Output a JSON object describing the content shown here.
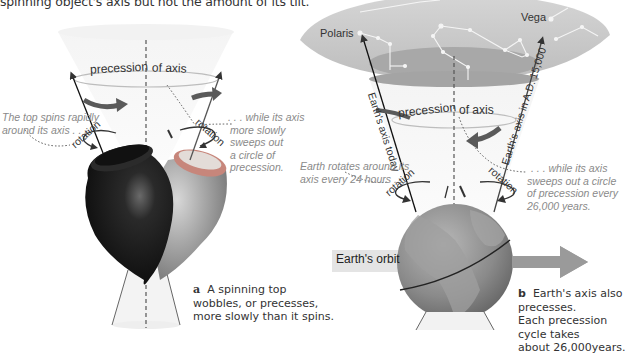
{
  "intro_text": "spinning object's axis but not the amount of its tilt.",
  "panel_a": {
    "cone_label_left": "precession",
    "cone_label_right": "of axis",
    "rotation_left": "rotation",
    "rotation_right": "rotation",
    "note_left": [
      "The top spins rapidly",
      "around its axis . . ."
    ],
    "note_right": [
      ". . . while its axis",
      "more slowly",
      "sweeps out",
      "a circle of",
      "precession."
    ],
    "caption_letter": "a",
    "caption_lines": [
      "A spinning top",
      "wobbles, or precesses,",
      "more slowly than it spins."
    ]
  },
  "panel_b": {
    "star_polaris": "Polaris",
    "star_vega": "Vega",
    "cone_label_left": "precession",
    "cone_label_right": "of axis",
    "axis_today": "Earth's axis today",
    "axis_future": "Earth's axis in A.D. 15,000",
    "rotation_left": "rotation",
    "rotation_right": "rotation",
    "note_left": [
      "Earth rotates around its",
      "axis every 24 hours . . ."
    ],
    "note_right": [
      ". . . while its axis",
      "sweeps out a circle",
      "of precession every",
      "26,000 years."
    ],
    "orbit_label": "Earth's orbit",
    "caption_letter": "b",
    "caption_lines": [
      "Earth's axis also precesses.",
      "Each precession cycle takes",
      "about 26,000years."
    ]
  },
  "colors": {
    "cone_fill": "#efefef",
    "sky_dome": "#c8c8c8",
    "sky_dark": "#a5a5a5",
    "top_black": "#1a1a1a",
    "top_grey": "#9a9a9a",
    "top_rim_red": "#b56a5e",
    "globe": "#8c8c8c",
    "arrow_dark": "#555555",
    "orbit_arrow": "#9b9b9b",
    "note_text": "#8a8a8a"
  }
}
